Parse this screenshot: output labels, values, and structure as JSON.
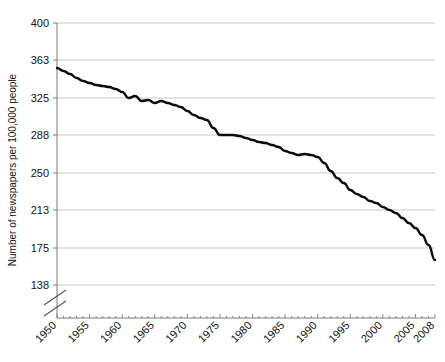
{
  "chart_data": {
    "type": "line",
    "title": "",
    "xlabel": "",
    "ylabel": "Number of newspapers per 100,000 people",
    "xlim": [
      1950,
      2008
    ],
    "ylim": [
      138,
      400
    ],
    "grid": true,
    "legend": false,
    "axis_break": true,
    "y_ticks": [
      400,
      363,
      325,
      288,
      250,
      213,
      175,
      138
    ],
    "x_ticks": [
      1950,
      1955,
      1960,
      1965,
      1970,
      1975,
      1980,
      1985,
      1990,
      1995,
      2000,
      2005,
      2008
    ],
    "x": [
      1950,
      1951,
      1952,
      1953,
      1954,
      1955,
      1956,
      1957,
      1958,
      1959,
      1960,
      1961,
      1962,
      1963,
      1964,
      1965,
      1966,
      1967,
      1968,
      1969,
      1970,
      1971,
      1972,
      1973,
      1974,
      1975,
      1976,
      1977,
      1978,
      1979,
      1980,
      1981,
      1982,
      1983,
      1984,
      1985,
      1986,
      1987,
      1988,
      1989,
      1990,
      1991,
      1992,
      1993,
      1994,
      1995,
      1996,
      1997,
      1998,
      1999,
      2000,
      2001,
      2002,
      2003,
      2004,
      2005,
      2006,
      2007,
      2008
    ],
    "values": [
      355,
      352,
      349,
      345,
      342,
      340,
      338,
      337,
      336,
      334,
      331,
      325,
      327,
      322,
      323,
      320,
      322,
      320,
      318,
      316,
      312,
      308,
      305,
      303,
      295,
      288,
      288,
      288,
      287,
      285,
      283,
      281,
      280,
      278,
      276,
      272,
      270,
      268,
      269,
      268,
      266,
      260,
      252,
      245,
      240,
      233,
      229,
      226,
      222,
      220,
      216,
      213,
      210,
      205,
      200,
      195,
      188,
      178,
      163
    ],
    "series": [
      {
        "name": "Newspapers per 100,000 people",
        "values": [
          355,
          352,
          349,
          345,
          342,
          340,
          338,
          337,
          336,
          334,
          331,
          325,
          327,
          322,
          323,
          320,
          322,
          320,
          318,
          316,
          312,
          308,
          305,
          303,
          295,
          288,
          288,
          288,
          287,
          285,
          283,
          281,
          280,
          278,
          276,
          272,
          270,
          268,
          269,
          268,
          266,
          260,
          252,
          245,
          240,
          233,
          229,
          226,
          222,
          220,
          216,
          213,
          210,
          205,
          200,
          195,
          188,
          178,
          163
        ]
      }
    ],
    "colors": {
      "line": "#0b0b0b",
      "grid": "#b9b9b9",
      "axis": "#7a7a7a",
      "text": "#111111",
      "background": "#ffffff"
    }
  }
}
